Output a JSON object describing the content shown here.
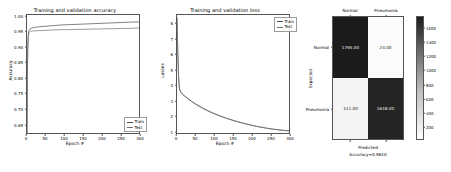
{
  "figure": {
    "background": "#ffffff",
    "panels": [
      "accuracy",
      "loss",
      "confusion_matrix"
    ]
  },
  "chart_data": [
    {
      "type": "line",
      "id": "accuracy",
      "title": "Training and validation accuracy",
      "xlabel": "Epoch #",
      "ylabel": "Accuracy",
      "xlim": [
        0,
        300
      ],
      "ylim": [
        0.62,
        1.005
      ],
      "xticks": [
        0,
        50,
        100,
        150,
        200,
        250,
        300
      ],
      "xticklabels": [
        "0",
        "50",
        "100",
        "150",
        "200",
        "250",
        "300"
      ],
      "yticks": [
        0.65,
        0.7,
        0.75,
        0.8,
        0.85,
        0.9,
        0.95,
        1.0
      ],
      "yticklabels": [
        "0.65",
        "0.70",
        "0.75",
        "0.80",
        "0.85",
        "0.90",
        "0.95",
        "1.00"
      ],
      "grid": false,
      "legend_position": "lower right",
      "series": [
        {
          "name": "Train",
          "color": "#4a4a4a",
          "x": [
            0,
            1,
            2,
            3,
            4,
            5,
            6,
            8,
            10,
            15,
            20,
            30,
            40,
            50,
            70,
            90,
            110,
            130,
            150,
            170,
            190,
            210,
            230,
            250,
            270,
            290,
            300
          ],
          "values": [
            0.625,
            0.818,
            0.901,
            0.934,
            0.948,
            0.955,
            0.957,
            0.96,
            0.962,
            0.964,
            0.965,
            0.967,
            0.968,
            0.969,
            0.971,
            0.973,
            0.974,
            0.975,
            0.976,
            0.977,
            0.978,
            0.979,
            0.98,
            0.981,
            0.982,
            0.983,
            0.983
          ]
        },
        {
          "name": "Test",
          "color": "#6f6f6f",
          "x": [
            0,
            1,
            2,
            3,
            4,
            5,
            6,
            8,
            10,
            15,
            20,
            30,
            40,
            50,
            70,
            90,
            110,
            130,
            150,
            170,
            190,
            210,
            230,
            250,
            270,
            290,
            300
          ],
          "values": [
            0.625,
            0.812,
            0.893,
            0.926,
            0.94,
            0.948,
            0.95,
            0.952,
            0.953,
            0.954,
            0.954,
            0.955,
            0.955,
            0.956,
            0.957,
            0.958,
            0.958,
            0.959,
            0.959,
            0.96,
            0.96,
            0.961,
            0.961,
            0.962,
            0.962,
            0.963,
            0.963
          ]
        }
      ]
    },
    {
      "type": "line",
      "id": "loss",
      "title": "Training and validation loss",
      "xlabel": "Epoch #",
      "ylabel": "Losses",
      "xlim": [
        0,
        300
      ],
      "ylim": [
        0.85,
        8.6
      ],
      "xticks": [
        0,
        50,
        100,
        150,
        200,
        250,
        300
      ],
      "xticklabels": [
        "0",
        "50",
        "100",
        "150",
        "200",
        "250",
        "300"
      ],
      "yticks": [
        1,
        2,
        3,
        4,
        5,
        6,
        7,
        8
      ],
      "yticklabels": [
        "1",
        "2",
        "3",
        "4",
        "5",
        "6",
        "7",
        "8"
      ],
      "grid": false,
      "legend_position": "upper right",
      "series": [
        {
          "name": "Train",
          "color": "#4a4a4a",
          "x": [
            0,
            2,
            4,
            6,
            8,
            10,
            15,
            20,
            30,
            40,
            50,
            70,
            90,
            110,
            130,
            150,
            170,
            190,
            210,
            230,
            250,
            270,
            290,
            300
          ],
          "values": [
            8.45,
            6.3,
            4.7,
            3.95,
            3.72,
            3.62,
            3.48,
            3.38,
            3.18,
            3.0,
            2.84,
            2.56,
            2.32,
            2.12,
            1.94,
            1.78,
            1.64,
            1.52,
            1.41,
            1.32,
            1.24,
            1.18,
            1.13,
            1.12
          ]
        },
        {
          "name": "Test",
          "color": "#6f6f6f",
          "x": [
            0,
            2,
            4,
            6,
            8,
            10,
            15,
            20,
            30,
            40,
            50,
            70,
            90,
            110,
            130,
            150,
            170,
            190,
            210,
            230,
            250,
            270,
            290,
            300
          ],
          "values": [
            8.42,
            6.26,
            4.66,
            3.92,
            3.7,
            3.6,
            3.46,
            3.36,
            3.16,
            2.98,
            2.82,
            2.54,
            2.3,
            2.1,
            1.92,
            1.77,
            1.63,
            1.51,
            1.4,
            1.31,
            1.23,
            1.17,
            1.12,
            1.11
          ]
        }
      ]
    },
    {
      "type": "heatmap",
      "id": "confusion_matrix",
      "xlabel": "Predicted",
      "ylabel": "Expected",
      "subcaption": "Accuracy=0.9610",
      "xticklabels": [
        "Normal",
        "Pneumonia"
      ],
      "yticklabels": [
        "Normal",
        "Pneumonia"
      ],
      "cells": [
        [
          {
            "text": "1765.00",
            "value": 1765,
            "fill": "#1b1b1b",
            "text_color": "#f2f2f2"
          },
          {
            "text": "24.00",
            "value": 24,
            "fill": "#fbfbfb",
            "text_color": "#1b1b1b"
          }
        ],
        [
          {
            "text": "111.00",
            "value": 111,
            "fill": "#f4f4f4",
            "text_color": "#1b1b1b"
          },
          {
            "text": "1618.00",
            "value": 1618,
            "fill": "#242424",
            "text_color": "#f2f2f2"
          }
        ]
      ],
      "colorbar": {
        "ticks": [
          200,
          400,
          600,
          800,
          1000,
          1200,
          1400,
          1600
        ],
        "ticklabels": [
          "200",
          "400",
          "600",
          "800",
          "1000",
          "1200",
          "1400",
          "1600"
        ],
        "vmin": 24,
        "vmax": 1765,
        "cmap_low": "#ffffff",
        "cmap_high": "#1b1b1b"
      }
    }
  ]
}
